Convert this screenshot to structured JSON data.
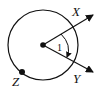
{
  "diagram": {
    "type": "geometry-circle-central-angle",
    "points": {
      "x_label": "X",
      "y_label": "Y",
      "z_label": "Z"
    },
    "angle_label": "1",
    "colors": {
      "stroke": "#111111",
      "background": "#ffffff"
    }
  }
}
